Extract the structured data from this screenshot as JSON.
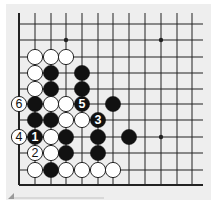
{
  "diagram": {
    "type": "go-board-fragment",
    "grid": {
      "columns_x": [
        19,
        35,
        51,
        66,
        82,
        98,
        113,
        129,
        145,
        161,
        177,
        192
      ],
      "rows_y": [
        24,
        40,
        57,
        73,
        89,
        104,
        120,
        137,
        153,
        170,
        185
      ],
      "left_edge": true,
      "bottom_edge": true,
      "top_open": true,
      "right_open": true
    },
    "hoshi": [
      {
        "col": 3,
        "row": 1
      },
      {
        "col": 9,
        "row": 1
      },
      {
        "col": 9,
        "row": 7
      }
    ],
    "stones": [
      {
        "color": "white",
        "col": 1,
        "row": 2
      },
      {
        "color": "white",
        "col": 2,
        "row": 2
      },
      {
        "color": "white",
        "col": 3,
        "row": 2
      },
      {
        "color": "white",
        "col": 1,
        "row": 3
      },
      {
        "color": "black",
        "col": 2,
        "row": 3
      },
      {
        "color": "black",
        "col": 4,
        "row": 3
      },
      {
        "color": "white",
        "col": 1,
        "row": 4
      },
      {
        "color": "black",
        "col": 2,
        "row": 4
      },
      {
        "color": "black",
        "col": 4,
        "row": 4
      },
      {
        "color": "white",
        "col": 0,
        "row": 5,
        "label": "6"
      },
      {
        "color": "black",
        "col": 1,
        "row": 5
      },
      {
        "color": "white",
        "col": 2,
        "row": 5
      },
      {
        "color": "white",
        "col": 3,
        "row": 5
      },
      {
        "color": "black",
        "col": 4,
        "row": 5,
        "label": "5"
      },
      {
        "color": "black",
        "col": 6,
        "row": 5
      },
      {
        "color": "black",
        "col": 1,
        "row": 6
      },
      {
        "color": "black",
        "col": 2,
        "row": 6
      },
      {
        "color": "white",
        "col": 3,
        "row": 6
      },
      {
        "color": "white",
        "col": 4,
        "row": 6
      },
      {
        "color": "black",
        "col": 5,
        "row": 6,
        "label": "3"
      },
      {
        "color": "white",
        "col": 0,
        "row": 7,
        "label": "4"
      },
      {
        "color": "black",
        "col": 1,
        "row": 7,
        "label": "1"
      },
      {
        "color": "white",
        "col": 2,
        "row": 7
      },
      {
        "color": "black",
        "col": 3,
        "row": 7
      },
      {
        "color": "black",
        "col": 5,
        "row": 7
      },
      {
        "color": "black",
        "col": 7,
        "row": 7
      },
      {
        "color": "white",
        "col": 1,
        "row": 8,
        "label": "2"
      },
      {
        "color": "white",
        "col": 2,
        "row": 8
      },
      {
        "color": "black",
        "col": 3,
        "row": 8
      },
      {
        "color": "black",
        "col": 5,
        "row": 8
      },
      {
        "color": "white",
        "col": 1,
        "row": 9
      },
      {
        "color": "black",
        "col": 2,
        "row": 9
      },
      {
        "color": "white",
        "col": 3,
        "row": 9
      },
      {
        "color": "white",
        "col": 4,
        "row": 9
      },
      {
        "color": "white",
        "col": 5,
        "row": 9
      },
      {
        "color": "white",
        "col": 6,
        "row": 9
      }
    ],
    "move_labels": [
      "1",
      "2",
      "3",
      "4",
      "5",
      "6"
    ],
    "colors": {
      "background": "#eeeeee",
      "line": "#222222",
      "black_stone": "#111111",
      "white_stone": "#ffffff"
    }
  }
}
